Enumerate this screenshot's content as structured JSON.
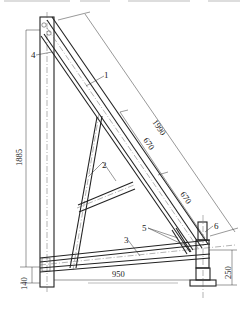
{
  "diagram": {
    "type": "engineering-drawing",
    "part_labels": [
      {
        "id": "1",
        "text": "1"
      },
      {
        "id": "2",
        "text": "2"
      },
      {
        "id": "3",
        "text": "3"
      },
      {
        "id": "4",
        "text": "4"
      },
      {
        "id": "5",
        "text": "5"
      },
      {
        "id": "6",
        "text": "6"
      }
    ],
    "dimensions": {
      "diagonal_total": "1990",
      "diagonal_upper_segment": "670",
      "diagonal_lower_segment": "670",
      "vertical_height": "1885",
      "base_offset": "140",
      "horizontal_span": "950",
      "support_height": "250"
    },
    "colors": {
      "line": "#222222",
      "background": "#ffffff"
    }
  }
}
